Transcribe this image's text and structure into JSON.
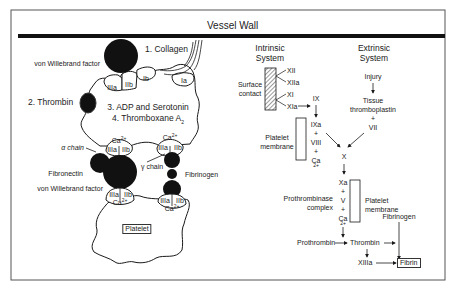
{
  "header": {
    "title": "Vessel Wall"
  },
  "left_panel": {
    "collagen_label": "1. Collagen",
    "vwf_top_label": "von Willebrand factor",
    "thrombin_label": "2. Thrombin",
    "adp_label": "3. ADP and Serotonin",
    "thromboxane_label": "4. Thromboxane A",
    "thromboxane_sub": "2",
    "receptor_top": [
      "IIIa",
      "IIb",
      "Ib",
      "Ia"
    ],
    "ca_label": "Ca",
    "ca_sup": "2+",
    "alpha_chain": "α chain",
    "gamma_chain": "γ chain",
    "fibronectin": "Fibronectin",
    "vwf_bottom_label": "von Willebrand factor",
    "fibrinogen": "Fibrinogen",
    "receptor_pair": [
      "IIIa",
      "IIb"
    ],
    "platelet_label": "Platelet"
  },
  "intrinsic": {
    "title_line1": "Intrinsic",
    "title_line2": "System",
    "surface_line1": "Surface",
    "surface_line2": "contact",
    "factors": [
      "XII",
      "XIIa",
      "XI",
      "XIa"
    ],
    "ix": "IX",
    "complex": [
      "IXa",
      "+",
      "VIII",
      "+",
      "Ca"
    ],
    "membrane_line1": "Platelet",
    "membrane_line2": "membrane"
  },
  "extrinsic": {
    "title_line1": "Extrinsic",
    "title_line2": "System",
    "injury": "Injury",
    "tissue_line1": "Tissue",
    "tissue_line2": "thromboplastin",
    "plus": "+",
    "vii": "VII"
  },
  "common": {
    "x": "X",
    "prothrombinase_line1": "Prothrombinase",
    "prothrombinase_line2": "complex",
    "complex": [
      "Xa",
      "+",
      "V",
      "+",
      "Ca"
    ],
    "membrane_line1": "Platelet",
    "membrane_line2": "membrane",
    "fibrinogen": "Fibrinogen",
    "prothrombin": "Prothrombin",
    "thrombin": "Thrombin",
    "xiiia": "XIIIa",
    "fibrin": "Fibrin"
  },
  "colors": {
    "ink": "#1a1a1a",
    "background": "#ffffff"
  }
}
